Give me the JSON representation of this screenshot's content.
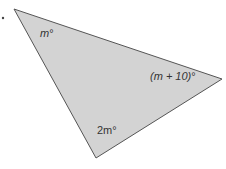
{
  "diagram": {
    "type": "triangle",
    "fill": "#d3d3d3",
    "stroke": "#555555",
    "vertices": [
      [
        14,
        9
      ],
      [
        222,
        79
      ],
      [
        96,
        158
      ]
    ],
    "angles": [
      {
        "vertex": "top-left",
        "label_var": "m",
        "label_suffix": "°"
      },
      {
        "vertex": "right",
        "label_var": "(m + 10)",
        "label_suffix": "°"
      },
      {
        "vertex": "bottom",
        "label_var": "2m",
        "label_suffix": "°"
      }
    ]
  }
}
